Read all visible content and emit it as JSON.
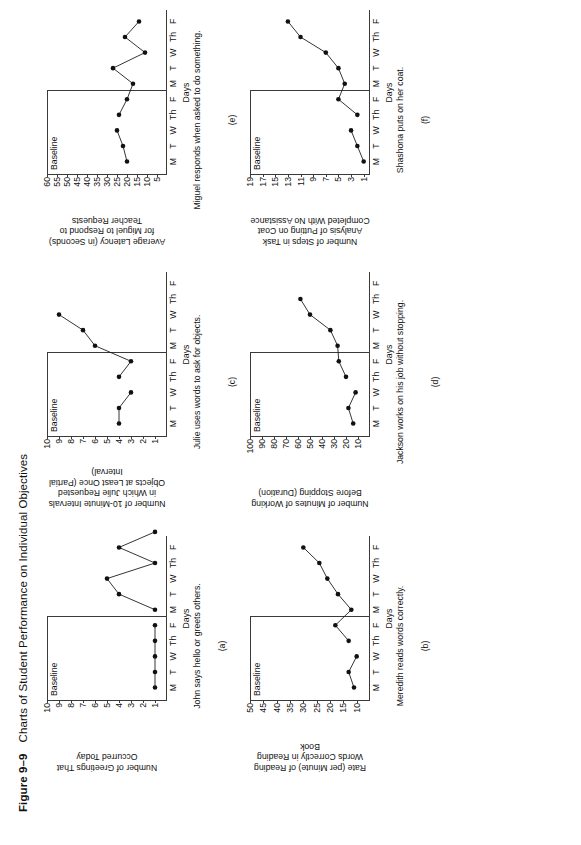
{
  "figure": {
    "number": "Figure 9–9",
    "title": "Charts of Student Performance on Individual Objectives"
  },
  "common": {
    "xlabel": "Days",
    "phase_label": "Baseline",
    "day_ticks": [
      "M",
      "T",
      "W",
      "Th",
      "F",
      "M",
      "T",
      "W",
      "Th",
      "F"
    ]
  },
  "charts": [
    {
      "id": "(a)",
      "panel": "a",
      "caption": "John says hello or greets others.",
      "chart_data": {
        "type": "line",
        "title": "",
        "ylabel": "Number of Greetings That Occurred Today",
        "xlabel": "Days",
        "categories": [
          "M",
          "T",
          "W",
          "Th",
          "F",
          "M",
          "T",
          "W",
          "Th",
          "F"
        ],
        "yticks": [
          1,
          2,
          3,
          4,
          5,
          6,
          7,
          8,
          9,
          10
        ],
        "ylim": [
          0,
          10
        ],
        "phase_split_after": 5,
        "phases": [
          {
            "name": "Baseline",
            "values": [
              1,
              1,
              1,
              1,
              1
            ]
          },
          {
            "name": "Intervention",
            "values": [
              1,
              4,
              5,
              1,
              4,
              1
            ]
          }
        ],
        "values": [
          1,
          1,
          1,
          1,
          1,
          1,
          4,
          5,
          1,
          4
        ],
        "grid": false,
        "legend": "none"
      }
    },
    {
      "id": "(b)",
      "panel": "b",
      "caption": "Meredith reads words correctly.",
      "chart_data": {
        "type": "line",
        "title": "",
        "ylabel": "Rate (per Minute) of Reading Words Correctly in Reading Book",
        "xlabel": "Days",
        "categories": [
          "M",
          "T",
          "W",
          "Th",
          "F",
          "M",
          "T",
          "W",
          "Th",
          "F"
        ],
        "yticks": [
          10,
          15,
          20,
          25,
          30,
          35,
          40,
          45,
          50
        ],
        "ylim": [
          5,
          50
        ],
        "phase_split_after": 5,
        "phases": [
          {
            "name": "Baseline",
            "values": [
              11,
              13,
              10
            ]
          },
          {
            "name": "Intervention",
            "values": [
              13,
              18,
              12,
              17,
              21,
              24,
              30
            ]
          }
        ],
        "values": [
          11,
          13,
          10,
          13,
          18,
          12,
          17,
          21,
          24,
          30
        ],
        "grid": false,
        "legend": "none"
      }
    },
    {
      "id": "(c)",
      "panel": "c",
      "caption": "Julie uses words to ask for objects.",
      "chart_data": {
        "type": "line",
        "title": "",
        "ylabel": "Number of 10-Minute Intervals in Which Julie Requested Objects at Least Once (Partial Interval)",
        "xlabel": "Days",
        "categories": [
          "M",
          "T",
          "W",
          "Th",
          "F",
          "M",
          "T",
          "W",
          "Th",
          "F"
        ],
        "yticks": [
          1,
          2,
          3,
          4,
          5,
          6,
          7,
          8,
          9,
          10
        ],
        "ylim": [
          0,
          10
        ],
        "phase_split_after": 5,
        "phases": [
          {
            "name": "Baseline",
            "values": [
              4,
              4,
              3
            ]
          },
          {
            "name": "Intervention",
            "values": [
              4,
              3,
              6,
              7,
              9
            ]
          }
        ],
        "values": [
          4,
          4,
          3,
          4,
          3,
          6,
          7,
          9
        ],
        "grid": false,
        "legend": "none"
      }
    },
    {
      "id": "(d)",
      "panel": "d",
      "caption": "Jackson works on his job without stopping.",
      "chart_data": {
        "type": "line",
        "title": "",
        "ylabel": "Number of Minutes of Working Before Stopping (Duration)",
        "xlabel": "Days",
        "categories": [
          "M",
          "T",
          "W",
          "Th",
          "F",
          "M",
          "T",
          "W",
          "Th",
          "F"
        ],
        "yticks": [
          10,
          20,
          30,
          40,
          50,
          60,
          70,
          80,
          90,
          100
        ],
        "ylim": [
          0,
          100
        ],
        "phase_split_after": 5,
        "phases": [
          {
            "name": "Baseline",
            "values": [
              14,
              18,
              12
            ]
          },
          {
            "name": "Intervention",
            "values": [
              20,
              26,
              27,
              33,
              50,
              58
            ]
          }
        ],
        "values": [
          14,
          18,
          12,
          20,
          26,
          27,
          33,
          50,
          58
        ],
        "grid": false,
        "legend": "none"
      }
    },
    {
      "id": "(e)",
      "panel": "e",
      "caption": "Miguel responds when asked to do something.",
      "chart_data": {
        "type": "line",
        "title": "",
        "ylabel": "Average Latency (in Seconds) for Miguel to Respond to Teacher Requests",
        "xlabel": "Days",
        "categories": [
          "M",
          "T",
          "W",
          "Th",
          "F",
          "M",
          "T",
          "W",
          "Th",
          "F"
        ],
        "yticks": [
          5,
          10,
          15,
          20,
          25,
          30,
          35,
          40,
          45,
          50,
          55,
          60
        ],
        "ylim": [
          0,
          60
        ],
        "phase_split_after": 5,
        "phases": [
          {
            "name": "Baseline",
            "values": [
              20,
              22,
              25
            ]
          },
          {
            "name": "Intervention",
            "values": [
              24,
              20,
              17,
              27,
              11,
              21,
              14
            ]
          }
        ],
        "values": [
          20,
          22,
          25,
          24,
          20,
          17,
          27,
          11,
          21,
          14
        ],
        "grid": false,
        "legend": "none"
      }
    },
    {
      "id": "(f)",
      "panel": "f",
      "caption": "Shashona puts on her coat.",
      "chart_data": {
        "type": "line",
        "title": "",
        "ylabel": "Number of Steps in Task Analysis of Putting on Coat Completed With No Assistance",
        "xlabel": "Days",
        "categories": [
          "M",
          "T",
          "W",
          "Th",
          "F",
          "M",
          "T",
          "W",
          "Th",
          "F"
        ],
        "yticks": [
          1,
          3,
          5,
          7,
          9,
          11,
          13,
          15,
          17,
          19
        ],
        "ylim": [
          0,
          19
        ],
        "phase_split_after": 5,
        "phases": [
          {
            "name": "Baseline",
            "values": [
              1,
              2,
              3
            ]
          },
          {
            "name": "Intervention",
            "values": [
              2,
              5,
              4,
              5,
              7,
              11,
              13
            ]
          }
        ],
        "values": [
          1,
          2,
          3,
          2,
          5,
          4,
          5,
          7,
          11,
          13
        ],
        "grid": false,
        "legend": "none"
      }
    }
  ]
}
